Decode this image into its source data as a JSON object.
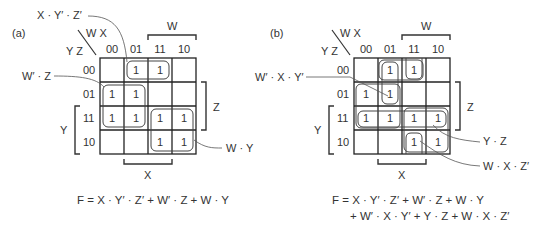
{
  "panel_a": {
    "label": "(a)",
    "corner_top": "W X",
    "corner_left": "Y Z",
    "col_headers": [
      "00",
      "01",
      "11",
      "10"
    ],
    "row_headers": [
      "00",
      "01",
      "11",
      "10"
    ],
    "cells": [
      [
        "",
        "1",
        "1",
        ""
      ],
      [
        "1",
        "1",
        "",
        ""
      ],
      [
        "1",
        "1",
        "1",
        "1"
      ],
      [
        "",
        "",
        "1",
        "1"
      ]
    ],
    "brace_labels": {
      "W": "W",
      "X": "X",
      "Y": "Y",
      "Z": "Z"
    },
    "annotations": [
      "X · Y′ · Z′",
      "W′ · Z",
      "W · Y"
    ],
    "equation": "F = X · Y′ · Z′ + W′ · Z + W · Y"
  },
  "panel_b": {
    "label": "(b)",
    "corner_top": "W X",
    "corner_left": "Y Z",
    "col_headers": [
      "00",
      "01",
      "11",
      "10"
    ],
    "row_headers": [
      "00",
      "01",
      "11",
      "10"
    ],
    "cells": [
      [
        "",
        "1",
        "1",
        ""
      ],
      [
        "1",
        "1",
        "",
        ""
      ],
      [
        "1",
        "1",
        "1",
        "1"
      ],
      [
        "",
        "",
        "1",
        "1"
      ]
    ],
    "brace_labels": {
      "W": "W",
      "X": "X",
      "Y": "Y",
      "Z": "Z"
    },
    "annotations": [
      "W′ · X · Y′",
      "Y · Z",
      "W · X · Z′"
    ],
    "equation_line1": "F = X · Y′ · Z′ + W′ · Z + W · Y",
    "equation_line2": "+ W′ · X · Y′ + Y · Z + W · X · Z′"
  }
}
